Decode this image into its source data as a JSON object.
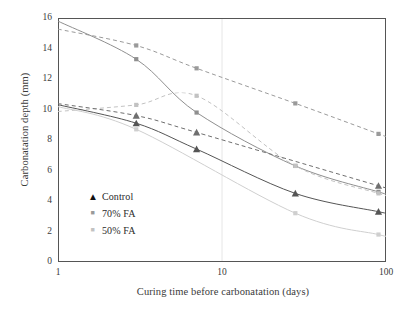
{
  "chart_data": {
    "type": "scatter",
    "title": "",
    "xlabel": "Curing time before carbonatation (days)",
    "ylabel": "Carbonatation depth (mm)",
    "xscale": "log",
    "xlim": [
      1,
      100
    ],
    "ylim": [
      0,
      16
    ],
    "xticks": [
      1,
      10,
      100
    ],
    "xticklabels": [
      "1",
      "10",
      "100"
    ],
    "yticks": [
      0,
      2,
      4,
      6,
      8,
      10,
      12,
      14,
      16
    ],
    "yticklabels": [
      "0",
      "2",
      "4",
      "6",
      "8",
      "10",
      "12",
      "14",
      "16"
    ],
    "grid": "vertical-minor-faint",
    "legend_position": "lower-left-inside",
    "legend": [
      {
        "label": "Control",
        "marker": "triangle",
        "color": "#111111"
      },
      {
        "label": "70% FA",
        "marker": "square",
        "color": "#9a9a9a"
      },
      {
        "label": "50% FA",
        "marker": "square",
        "color": "#c2c2c2"
      }
    ],
    "series": [
      {
        "name": "70% FA (dashed)",
        "style": "dashed",
        "color": "#9a9a9a",
        "marker": "square",
        "points": [
          {
            "x": 3,
            "y": 14.2
          },
          {
            "x": 7,
            "y": 12.7
          },
          {
            "x": 28,
            "y": 10.4
          },
          {
            "x": 90,
            "y": 8.4
          }
        ]
      },
      {
        "name": "70% FA (solid)",
        "style": "solid",
        "color": "#8f8f8f",
        "marker": "square",
        "points": [
          {
            "x": 3,
            "y": 13.3
          },
          {
            "x": 7,
            "y": 9.8
          },
          {
            "x": 28,
            "y": 6.3
          },
          {
            "x": 90,
            "y": 4.6
          }
        ]
      },
      {
        "name": "50% FA (dashed)",
        "style": "dashed",
        "color": "#c2c2c2",
        "marker": "square",
        "points": [
          {
            "x": 3,
            "y": 10.3
          },
          {
            "x": 7,
            "y": 10.9
          },
          {
            "x": 28,
            "y": 6.3
          },
          {
            "x": 90,
            "y": 4.5
          }
        ]
      },
      {
        "name": "50% FA (solid)",
        "style": "solid",
        "color": "#cfcfcf",
        "marker": "square",
        "points": [
          {
            "x": 3,
            "y": 8.7
          },
          {
            "x": 28,
            "y": 3.2
          },
          {
            "x": 90,
            "y": 1.8
          }
        ]
      },
      {
        "name": "Control (dashed)",
        "style": "dashed",
        "color": "#6f6f6f",
        "marker": "triangle",
        "points": [
          {
            "x": 3,
            "y": 9.6
          },
          {
            "x": 7,
            "y": 8.5
          },
          {
            "x": 90,
            "y": 5.0
          }
        ]
      },
      {
        "name": "Control (solid)",
        "style": "solid",
        "color": "#555555",
        "marker": "triangle",
        "points": [
          {
            "x": 3,
            "y": 9.1
          },
          {
            "x": 7,
            "y": 7.4
          },
          {
            "x": 28,
            "y": 4.5
          },
          {
            "x": 90,
            "y": 3.3
          }
        ]
      }
    ]
  }
}
